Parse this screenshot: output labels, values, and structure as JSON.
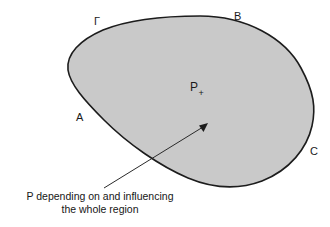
{
  "diagram": {
    "region": {
      "name": "shaded-region",
      "fill_color": "#c9c9c9",
      "stroke_color": "#1c1c1c"
    },
    "background_color": "#ffffff",
    "labels": {
      "boundary_gamma": "Γ",
      "point_b": "B",
      "point_a": "A",
      "point_c": "C",
      "interior_point": "P",
      "interior_point_subscript": "+"
    },
    "arrow": {
      "name": "pointer-arrow",
      "color": "#2a2a2a",
      "from": "caption",
      "to": "interior point P"
    },
    "caption": {
      "line1": "P depending on and influencing",
      "line2": "the whole region"
    }
  }
}
